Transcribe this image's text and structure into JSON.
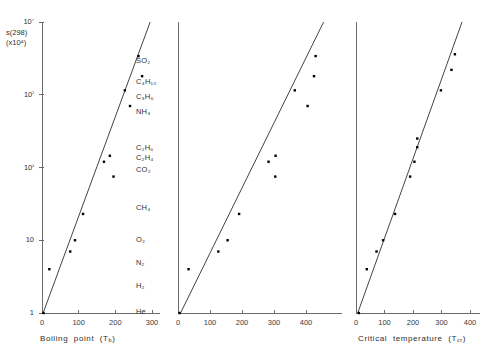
{
  "figure": {
    "title": "",
    "background": "#ffffff",
    "point_color": "#000000",
    "line_color": "#444444",
    "axis_color": "#6b6b6b"
  },
  "yaxis": {
    "label_line1": "s(298)",
    "label_line2": "(x10⁴)",
    "ticks": [
      "1",
      "10",
      "10²",
      "10³",
      "10⁴"
    ],
    "tick_values": [
      1,
      10,
      100,
      1000,
      10000
    ],
    "scale": "log",
    "range": [
      1,
      10000
    ]
  },
  "species": {
    "heading": "",
    "items": [
      "SO₂",
      "C₄H₁₀",
      "C₃H₆",
      "NH₃",
      "C₂H₆",
      "C₂H₄",
      "CO₂",
      "CH₄",
      "O₂",
      "N₂",
      "H₂",
      "He"
    ]
  },
  "chart_data": [
    {
      "type": "scatter",
      "title": "",
      "xlabel": "Boiling point (Tₑ)",
      "xlabel_plain": "Boiling point (Tb)",
      "ylabel": "s(298) (x10⁴)",
      "xlim": [
        0,
        360
      ],
      "ylim": [
        1,
        10000
      ],
      "yscale": "log",
      "grid": false,
      "xticks": [
        0,
        100,
        200,
        300
      ],
      "xtick_labels": [
        "0",
        "100",
        "200",
        "300"
      ],
      "points": [
        {
          "label": "He",
          "x": 4,
          "y": 1.0
        },
        {
          "label": "H₂",
          "x": 20,
          "y": 4.0
        },
        {
          "label": "N₂",
          "x": 77,
          "y": 7.0
        },
        {
          "label": "O₂",
          "x": 90,
          "y": 10.0
        },
        {
          "label": "CH₄",
          "x": 112,
          "y": 23.0
        },
        {
          "label": "CO₂",
          "x": 195,
          "y": 75.0
        },
        {
          "label": "C₂H₄",
          "x": 169,
          "y": 120.0
        },
        {
          "label": "C₂H₆",
          "x": 185,
          "y": 145.0
        },
        {
          "label": "NH₃",
          "x": 240,
          "y": 700.0
        },
        {
          "label": "C₃H₆",
          "x": 226,
          "y": 1150.0
        },
        {
          "label": "C₄H₁₀",
          "x": 273,
          "y": 1800.0
        },
        {
          "label": "SO₂",
          "x": 263,
          "y": 3400.0
        }
      ],
      "fit_line": {
        "x0": 3,
        "y0": 1.0,
        "x1": 295,
        "y1": 10000.0
      }
    },
    {
      "type": "scatter",
      "title": "",
      "xlabel": "Critical temperature (Tᴄᵣ)",
      "xlabel_plain": "Critical temperature (Tcr)",
      "ylabel": "s(298) (x10⁴)",
      "xlim": [
        0,
        470
      ],
      "ylim": [
        1,
        10000
      ],
      "yscale": "log",
      "grid": false,
      "xticks": [
        0,
        100,
        200,
        300,
        400
      ],
      "xtick_labels": [
        "0",
        "100",
        "200",
        "300",
        "400"
      ],
      "points": [
        {
          "label": "He",
          "x": 5,
          "y": 1.0
        },
        {
          "label": "H₂",
          "x": 33,
          "y": 4.0
        },
        {
          "label": "N₂",
          "x": 126,
          "y": 7.0
        },
        {
          "label": "O₂",
          "x": 155,
          "y": 10.0
        },
        {
          "label": "CH₄",
          "x": 191,
          "y": 23.0
        },
        {
          "label": "CO₂",
          "x": 304,
          "y": 75.0
        },
        {
          "label": "C₂H₄",
          "x": 283,
          "y": 120.0
        },
        {
          "label": "C₂H₆",
          "x": 305,
          "y": 145.0
        },
        {
          "label": "NH₃",
          "x": 405,
          "y": 700.0
        },
        {
          "label": "C₃H₆",
          "x": 365,
          "y": 1150.0
        },
        {
          "label": "C₄H₁₀",
          "x": 425,
          "y": 1800.0
        },
        {
          "label": "SO₂",
          "x": 430,
          "y": 3400.0
        }
      ],
      "fit_line": {
        "x0": 8,
        "y0": 1.0,
        "x1": 455,
        "y1": 10000.0
      }
    },
    {
      "type": "scatter",
      "title": "",
      "xlabel": "Lennard-Jones temperature (ε/k)",
      "xlabel_plain": "Lennard-Jones temperature (E/k)",
      "ylabel": "s(298) (x10⁴)",
      "xlim": [
        0,
        430
      ],
      "ylim": [
        1,
        10000
      ],
      "yscale": "log",
      "grid": false,
      "xticks": [
        0,
        100,
        200,
        300,
        400
      ],
      "xtick_labels": [
        "0",
        "100",
        "200",
        "300",
        "400"
      ],
      "points": [
        {
          "label": "He",
          "x": 10,
          "y": 1.0
        },
        {
          "label": "H₂",
          "x": 38,
          "y": 4.0
        },
        {
          "label": "N₂",
          "x": 72,
          "y": 7.0
        },
        {
          "label": "O₂",
          "x": 95,
          "y": 10.0
        },
        {
          "label": "CH₄",
          "x": 137,
          "y": 23.0
        },
        {
          "label": "CO₂",
          "x": 190,
          "y": 75.0
        },
        {
          "label": "C₂H₄",
          "x": 205,
          "y": 120.0
        },
        {
          "label": "C₂H₆",
          "x": 215,
          "y": 190.0
        },
        {
          "label": "NH₃",
          "x": 215,
          "y": 250.0
        },
        {
          "label": "C₃H₆",
          "x": 298,
          "y": 1150.0
        },
        {
          "label": "C₄H₁₀",
          "x": 335,
          "y": 2200.0
        },
        {
          "label": "SO₂",
          "x": 347,
          "y": 3600.0
        }
      ],
      "fit_line": {
        "x0": 6,
        "y0": 1.0,
        "x1": 372,
        "y1": 10000.0
      }
    }
  ]
}
